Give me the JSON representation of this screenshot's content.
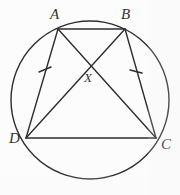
{
  "figure": {
    "background_color": "#fdfdfd",
    "stroke_color": "#1a1a1a",
    "labels": {
      "A": "A",
      "B": "B",
      "C": "C",
      "D": "D",
      "X": "X"
    },
    "geometry": {
      "circle": {
        "cx": 90,
        "cy": 100,
        "r": 79
      },
      "points": {
        "A": {
          "x": 58,
          "y": 29
        },
        "B": {
          "x": 125,
          "y": 29
        },
        "C": {
          "x": 156,
          "y": 138
        },
        "D": {
          "x": 26,
          "y": 138
        },
        "X": {
          "x": 92,
          "y": 68
        }
      },
      "segments": [
        {
          "name": "AB",
          "from": "A",
          "to": "B"
        },
        {
          "name": "AD",
          "from": "A",
          "to": "D",
          "tick_marks": 1
        },
        {
          "name": "BC",
          "from": "B",
          "to": "C",
          "tick_marks": 1
        },
        {
          "name": "DC",
          "from": "D",
          "to": "C"
        },
        {
          "name": "AC",
          "from": "A",
          "to": "C"
        },
        {
          "name": "BD",
          "from": "B",
          "to": "D"
        }
      ],
      "tick_marks": [
        {
          "on": "AD",
          "x": 45,
          "y": 70
        },
        {
          "on": "BC",
          "x": 136,
          "y": 70
        }
      ]
    }
  }
}
